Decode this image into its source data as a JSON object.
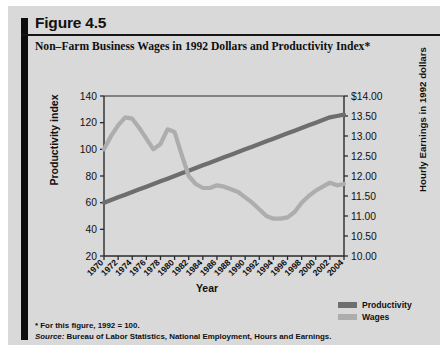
{
  "figure": {
    "number": "Figure 4.5",
    "title": "Non–Farm Business Wages in 1992 Dollars and Productivity Index*",
    "footnote": "* For this figure, 1992 = 100.",
    "source_label": "Source:",
    "source_text": " Bureau of Labor Statistics, National Employment, Hours and Earnings."
  },
  "legend": {
    "items": [
      {
        "label": "Productivity",
        "color": "#6e6e6e"
      },
      {
        "label": "Wages",
        "color": "#adadad"
      }
    ]
  },
  "colors": {
    "card_background": "#d9d9d9",
    "accent_bar": "#0d0d0d",
    "axis": "#2a2a2a",
    "productivity": "#6e6e6e",
    "wages": "#adadad"
  },
  "chart_data": {
    "type": "line",
    "title": "Non–Farm Business Wages in 1992 Dollars and Productivity Index*",
    "xlabel": "Year",
    "ylabel": "Productivity index",
    "y2label": "Hourly Earnings in 1992 dollars",
    "grid": false,
    "legend_position": "bottom-right",
    "xlim": [
      1970,
      2004
    ],
    "ylim": [
      20,
      140
    ],
    "y2lim": [
      10.0,
      14.0
    ],
    "yticks": [
      20,
      40,
      60,
      80,
      100,
      120,
      140
    ],
    "yticklabels": [
      "20",
      "40",
      "60",
      "80",
      "100",
      "120",
      "140"
    ],
    "y2ticks": [
      10.0,
      10.5,
      11.0,
      11.5,
      12.0,
      12.5,
      13.0,
      13.5,
      14.0
    ],
    "y2ticklabels": [
      "10.00",
      "10.50",
      "11.00",
      "11.50",
      "12.00",
      "12.50",
      "13.00",
      "13.50",
      "$14.00"
    ],
    "xticks": [
      1970,
      1972,
      1974,
      1976,
      1978,
      1980,
      1982,
      1984,
      1986,
      1988,
      1990,
      1992,
      1994,
      1996,
      1998,
      2000,
      2002,
      2004
    ],
    "xticklabels": [
      "1970",
      "1972",
      "1974",
      "1976",
      "1978",
      "1980",
      "1982",
      "1984",
      "1986",
      "1988",
      "1990",
      "1992",
      "1994",
      "1996",
      "1998",
      "2000",
      "2002",
      "2004"
    ],
    "x": [
      1970,
      1971,
      1972,
      1973,
      1974,
      1975,
      1976,
      1977,
      1978,
      1979,
      1980,
      1981,
      1982,
      1983,
      1984,
      1985,
      1986,
      1987,
      1988,
      1989,
      1990,
      1991,
      1992,
      1993,
      1994,
      1995,
      1996,
      1997,
      1998,
      1999,
      2000,
      2001,
      2002,
      2003,
      2004
    ],
    "series": [
      {
        "name": "Productivity",
        "axis": "left",
        "color": "#6e6e6e",
        "units": "index (1992 = 100)",
        "values": [
          60,
          62,
          64,
          66,
          68,
          70,
          72,
          74,
          76,
          78,
          80,
          82,
          84,
          86,
          88,
          90,
          92,
          94,
          96,
          98,
          100,
          102,
          104,
          106,
          108,
          110,
          112,
          114,
          116,
          118,
          120,
          122,
          124,
          125,
          126
        ]
      },
      {
        "name": "Wages",
        "axis": "right",
        "color": "#adadad",
        "units": "hourly earnings in 1992 dollars",
        "values_index": [
          100,
          110,
          118,
          124,
          123,
          116,
          108,
          100,
          104,
          115,
          113,
          96,
          80,
          74,
          71,
          71,
          73,
          72,
          70,
          68,
          64,
          60,
          55,
          50,
          48,
          48,
          49,
          53,
          60,
          65,
          69,
          72,
          75,
          73,
          74
        ],
        "values_dollars": [
          11.33,
          11.67,
          11.93,
          12.13,
          12.1,
          11.87,
          11.6,
          11.33,
          11.47,
          11.83,
          11.77,
          11.2,
          10.67,
          10.47,
          10.37,
          10.37,
          10.43,
          10.4,
          10.33,
          10.27,
          10.13,
          10.0,
          9.83,
          9.67,
          9.6,
          9.6,
          9.63,
          9.77,
          10.0,
          10.17,
          10.3,
          10.4,
          10.5,
          10.43,
          10.47
        ]
      }
    ]
  }
}
